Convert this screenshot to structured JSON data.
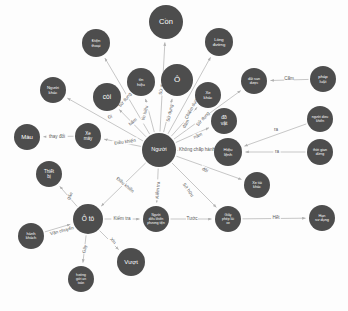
{
  "diagram": {
    "type": "node-link-network",
    "colors": {
      "node_fill": "#4d4d4d",
      "node_text": "#ffffff",
      "edge_stroke": "#b9b9b9",
      "edge_text": "#5a5a5a",
      "background": "#fdfdfd"
    },
    "nodes": [
      {
        "id": "con",
        "label": "Cồn",
        "x": 166,
        "y": 22,
        "r": 17,
        "font": 7.5,
        "lines": [
          "Cồn"
        ]
      },
      {
        "id": "dien-thoai",
        "label": "Điện thoại",
        "x": 96,
        "y": 43,
        "r": 14,
        "font": 4.2,
        "lines": [
          "Điện",
          "thoại"
        ]
      },
      {
        "id": "long-duong",
        "label": "Lòng đường",
        "x": 219,
        "y": 42,
        "r": 14,
        "font": 4.2,
        "lines": [
          "Lòng",
          "đường"
        ]
      },
      {
        "id": "tin-hieu",
        "label": "Tín hiệu",
        "x": 141,
        "y": 82,
        "r": 14,
        "font": 4.2,
        "lines": [
          "tín",
          "hiệu"
        ]
      },
      {
        "id": "o",
        "label": "Ô",
        "x": 177,
        "y": 80,
        "r": 16,
        "font": 8,
        "lines": [
          "Ô"
        ]
      },
      {
        "id": "xe-khac",
        "label": "Xe khác",
        "x": 208,
        "y": 95,
        "r": 13,
        "font": 4.2,
        "lines": [
          "Xe",
          "khác"
        ]
      },
      {
        "id": "coi",
        "label": "còi",
        "x": 107,
        "y": 97,
        "r": 14,
        "font": 6.5,
        "lines": [
          "còi"
        ]
      },
      {
        "id": "do-vat",
        "label": "đồ vật",
        "x": 224,
        "y": 121,
        "r": 13,
        "font": 5,
        "lines": [
          "đồ",
          "vật"
        ]
      },
      {
        "id": "nguoi-khac",
        "label": "Người khác",
        "x": 53,
        "y": 90,
        "r": 13,
        "font": 4.2,
        "lines": [
          "Người",
          "khác"
        ]
      },
      {
        "id": "mau",
        "label": "Màu",
        "x": 27,
        "y": 137,
        "r": 13,
        "font": 6,
        "lines": [
          "Màu"
        ]
      },
      {
        "id": "xe-may",
        "label": "Xe máy",
        "x": 88,
        "y": 136,
        "r": 13,
        "font": 4.5,
        "lines": [
          "Xe",
          "máy"
        ]
      },
      {
        "id": "nguoi",
        "label": "Người",
        "x": 159,
        "y": 150,
        "r": 17,
        "font": 5.5,
        "lines": [
          "Người"
        ]
      },
      {
        "id": "hieu-lenh",
        "label": "Hiệu lệnh",
        "x": 228,
        "y": 152,
        "r": 14,
        "font": 4.3,
        "lines": [
          "Hiệu",
          "lệnh"
        ]
      },
      {
        "id": "dat-san-duoc",
        "label": "đất san được",
        "x": 254,
        "y": 81,
        "r": 13,
        "font": 3.6,
        "lines": [
          "đất san",
          "được"
        ]
      },
      {
        "id": "cam-node",
        "label": "pháp luật",
        "x": 323,
        "y": 79,
        "r": 13,
        "font": 4.2,
        "lines": [
          "pháp",
          "luật"
        ]
      },
      {
        "id": "nguoi-dieu-khien",
        "label": "người điều khiển",
        "x": 320,
        "y": 119,
        "r": 13,
        "font": 3.4,
        "lines": [
          "người dieu",
          "khiển"
        ]
      },
      {
        "id": "thoi-gian",
        "label": "thời gian dừng",
        "x": 320,
        "y": 152,
        "r": 13,
        "font": 3.6,
        "lines": [
          "thời gian",
          "dừng"
        ]
      },
      {
        "id": "xe-tai-khac",
        "label": "Xe tải khác",
        "x": 257,
        "y": 185,
        "r": 13,
        "font": 3.8,
        "lines": [
          "Xe tải",
          "khác"
        ]
      },
      {
        "id": "thiet-bi",
        "label": "Thiết bị",
        "x": 49,
        "y": 174,
        "r": 13,
        "font": 4.5,
        "lines": [
          "Thiết",
          "bị"
        ]
      },
      {
        "id": "hanh-khach",
        "label": "hành khách",
        "x": 31,
        "y": 236,
        "r": 13,
        "font": 4,
        "lines": [
          "hành",
          "khách"
        ]
      },
      {
        "id": "o-to",
        "label": "Ô tô",
        "x": 88,
        "y": 219,
        "r": 15,
        "font": 6.5,
        "lines": [
          "Ô tô"
        ]
      },
      {
        "id": "phuong-tien",
        "label": "Người điều khiển",
        "x": 156,
        "y": 219,
        "r": 13,
        "font": 3.2,
        "lines": [
          "Người",
          "điều khiển",
          "phương tiện"
        ]
      },
      {
        "id": "giay-phep",
        "label": "Giấy phép lái xe",
        "x": 228,
        "y": 219,
        "r": 13,
        "font": 3.4,
        "lines": [
          "Giấy",
          "phép lái",
          "xe"
        ]
      },
      {
        "id": "han-su-dung",
        "label": "Hạn sử dụng",
        "x": 322,
        "y": 218,
        "r": 13,
        "font": 3.8,
        "lines": [
          "Hạn",
          "sử dụng"
        ]
      },
      {
        "id": "vuot",
        "label": "Vượt",
        "x": 131,
        "y": 262,
        "r": 14,
        "font": 6,
        "lines": [
          "Vượt"
        ]
      },
      {
        "id": "huong-di",
        "label": "hướng giới an toàn",
        "x": 81,
        "y": 279,
        "r": 13,
        "font": 3.3,
        "lines": [
          "hướng",
          "giới an",
          "toàn"
        ]
      }
    ],
    "edges": [
      {
        "from": "nguoi",
        "to": "con",
        "label": "Sử dụng",
        "lx": 162,
        "ly": 86,
        "rot": -80
      },
      {
        "from": "nguoi",
        "to": "dien-thoai",
        "label": "Sử dụng",
        "lx": 125,
        "ly": 100,
        "rot": -50
      },
      {
        "from": "nguoi",
        "to": "tin-hieu",
        "label": "tín hiệu",
        "lx": 145,
        "ly": 113,
        "rot": -75
      },
      {
        "from": "nguoi",
        "to": "o",
        "label": "Sử dụng",
        "lx": 170,
        "ly": 113,
        "rot": -77
      },
      {
        "from": "nguoi",
        "to": "xe-khac",
        "label": "Chiếm dụng",
        "lx": 192,
        "ly": 108,
        "rot": -62
      },
      {
        "from": "nguoi",
        "to": "coi",
        "label": "bấm",
        "lx": 133,
        "ly": 122,
        "rot": -40
      },
      {
        "from": "nguoi",
        "to": "do-vat",
        "label": "Sử dụng",
        "lx": 203,
        "ly": 119,
        "rot": -48
      },
      {
        "from": "nguoi",
        "to": "long-duong",
        "label": "đâm",
        "lx": 186,
        "ly": 124,
        "rot": -62
      },
      {
        "from": "nguoi",
        "to": "dat-san-duoc",
        "label": "nằm",
        "lx": 198,
        "ly": 136,
        "rot": -23
      },
      {
        "from": "nguoi",
        "to": "nguoi-khac",
        "label": "Đi",
        "lx": 110,
        "ly": 117,
        "rot": -20
      },
      {
        "from": "nguoi",
        "to": "xe-may",
        "label": "Điều khiển",
        "lx": 125,
        "ly": 142,
        "rot": -8
      },
      {
        "from": "xe-may",
        "to": "mau",
        "label": "thay đổi",
        "lx": 57,
        "ly": 137,
        "rot": 0
      },
      {
        "from": "nguoi",
        "to": "hieu-lenh",
        "label": "Không chấp hành",
        "lx": 197,
        "ly": 150,
        "rot": 0
      },
      {
        "from": "cam-node",
        "to": "dat-san-duoc",
        "label": "Cấm",
        "lx": 289,
        "ly": 79,
        "rot": 0
      },
      {
        "from": "nguoi-dieu-khien",
        "to": "hieu-lenh",
        "label": "ra",
        "lx": 276,
        "ly": 130,
        "rot": 0
      },
      {
        "from": "thoi-gian",
        "to": "hieu-lenh",
        "label": "ra",
        "lx": 277,
        "ly": 152,
        "rot": 0
      },
      {
        "from": "nguoi",
        "to": "xe-tai-khac",
        "label": "đội",
        "lx": 205,
        "ly": 170,
        "rot": 28
      },
      {
        "from": "nguoi",
        "to": "giay-phep",
        "label": "Sở hữu",
        "lx": 188,
        "ly": 190,
        "rot": 55
      },
      {
        "from": "nguoi",
        "to": "phuong-tien",
        "label": "Kiểm tra",
        "lx": 158,
        "ly": 190,
        "rot": -85
      },
      {
        "from": "nguoi",
        "to": "o-to",
        "label": "Điều khiển",
        "lx": 125,
        "ly": 185,
        "rot": 40
      },
      {
        "from": "o-to",
        "to": "phuong-tien",
        "label": "Kiểm tra",
        "lx": 122,
        "ly": 219,
        "rot": 0
      },
      {
        "from": "phuong-tien",
        "to": "giay-phep",
        "label": "Tước",
        "lx": 192,
        "ly": 219,
        "rot": 0
      },
      {
        "from": "giay-phep",
        "to": "han-su-dung",
        "label": "Hết",
        "lx": 276,
        "ly": 218,
        "rot": 0
      },
      {
        "from": "o-to",
        "to": "thiet-bi",
        "label": "gắn",
        "lx": 70,
        "ly": 196,
        "rot": -62
      },
      {
        "from": "hanh-khach",
        "to": "o-to",
        "label": "Vận chuyển",
        "lx": 62,
        "ly": 231,
        "rot": -15
      },
      {
        "from": "o-to",
        "to": "huong-di",
        "label": "Gây",
        "lx": 85,
        "ly": 249,
        "rot": -78
      },
      {
        "from": "o-to",
        "to": "vuot",
        "label": "Xin",
        "lx": 113,
        "ly": 241,
        "rot": 48
      }
    ]
  }
}
